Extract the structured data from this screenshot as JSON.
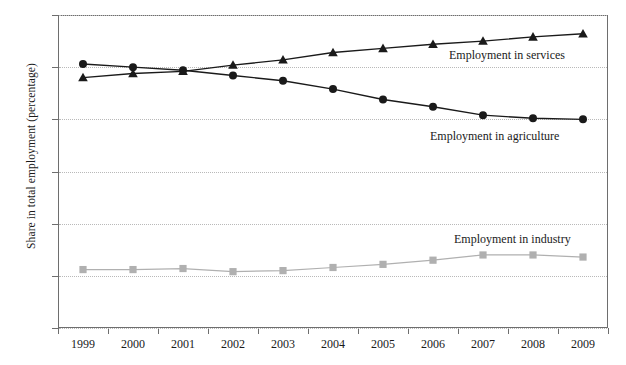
{
  "chart_data": {
    "type": "line",
    "title": "",
    "xlabel": "",
    "ylabel": "Share in total employment (percentage)",
    "categories": [
      "1999",
      "2000",
      "2001",
      "2002",
      "2003",
      "2004",
      "2005",
      "2006",
      "2007",
      "2008",
      "2009"
    ],
    "x": [
      1999,
      2000,
      2001,
      2002,
      2003,
      2004,
      2005,
      2006,
      2007,
      2008,
      2009
    ],
    "ylim": [
      15,
      45
    ],
    "xlim": [
      1999,
      2009
    ],
    "yticks": [
      15,
      20,
      25,
      30,
      35,
      40,
      45
    ],
    "grid": true,
    "legend_position": "inline-annotations",
    "series": [
      {
        "name": "Employment in agriculture",
        "marker": "circle",
        "color": "#1a1a1a",
        "values": [
          40.3,
          40.0,
          39.7,
          39.2,
          38.7,
          37.9,
          36.9,
          36.2,
          35.4,
          35.1,
          35.0
        ]
      },
      {
        "name": "Employment in services",
        "marker": "triangle",
        "color": "#1a1a1a",
        "values": [
          39.0,
          39.4,
          39.6,
          40.2,
          40.7,
          41.4,
          41.8,
          42.2,
          42.5,
          42.9,
          43.2
        ]
      },
      {
        "name": "Employment in industry",
        "marker": "square",
        "color": "#b0b0b0",
        "values": [
          20.6,
          20.6,
          20.7,
          20.4,
          20.5,
          20.8,
          21.1,
          21.5,
          22.0,
          22.0,
          21.8
        ]
      }
    ],
    "annotations": [
      {
        "text": "Employment in services",
        "series": "Employment in services"
      },
      {
        "text": "Employment in agriculture",
        "series": "Employment in agriculture"
      },
      {
        "text": "Employment in industry",
        "series": "Employment in industry"
      }
    ]
  },
  "axis": {
    "y_title": "Share in total employment (percentage)",
    "y_tick_labels": [
      "45",
      "40",
      "35",
      "30",
      "25",
      "20",
      "15"
    ],
    "x_tick_labels": [
      "1999",
      "2000",
      "2001",
      "2002",
      "2003",
      "2004",
      "2005",
      "2006",
      "2007",
      "2008",
      "2009"
    ]
  },
  "labels": {
    "services": "Employment in services",
    "agriculture": "Employment in agriculture",
    "industry": "Employment in industry"
  },
  "colors": {
    "dark_series": "#1a1a1a",
    "light_series": "#b0b0b0",
    "frame": "#6e6e6e",
    "gridline": "#b9b9b9",
    "background": "#ffffff"
  }
}
